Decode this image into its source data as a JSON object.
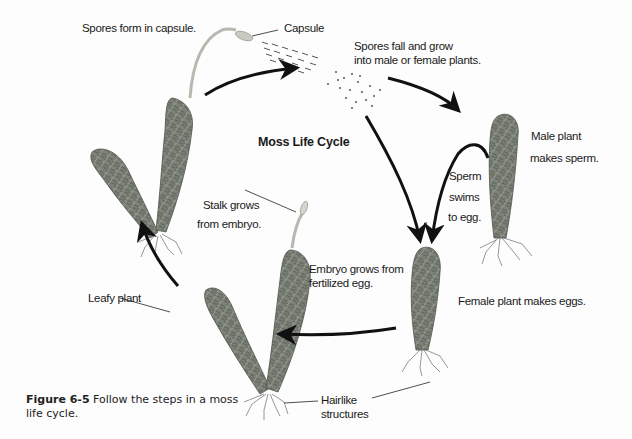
{
  "diagram": {
    "title": "Moss Life Cycle",
    "labels": {
      "spores_form": "Spores form in capsule.",
      "capsule": "Capsule",
      "spores_fall_line1": "Spores fall and grow",
      "spores_fall_line2": "into male or female plants.",
      "male_plant_line1": "Male plant",
      "male_plant_line2": "makes sperm.",
      "sperm_line1": "Sperm",
      "sperm_line2": "swims",
      "sperm_line3": "to egg.",
      "stalk_line1": "Stalk grows",
      "stalk_line2": "from embryo.",
      "embryo_line1": "Embryo grows from",
      "embryo_line2": "fertilized egg.",
      "female_plant": "Female plant makes eggs.",
      "leafy_plant": "Leafy plant",
      "hairlike_line1": "Hairlike",
      "hairlike_line2": "structures"
    },
    "caption": {
      "figure_number": "Figure 6-5",
      "text": " Follow the steps in a moss life cycle."
    },
    "colors": {
      "plant_fill": "#7a7f74",
      "plant_dark": "#4e534b",
      "arrow": "#111111",
      "text": "#1a1a1a"
    }
  }
}
